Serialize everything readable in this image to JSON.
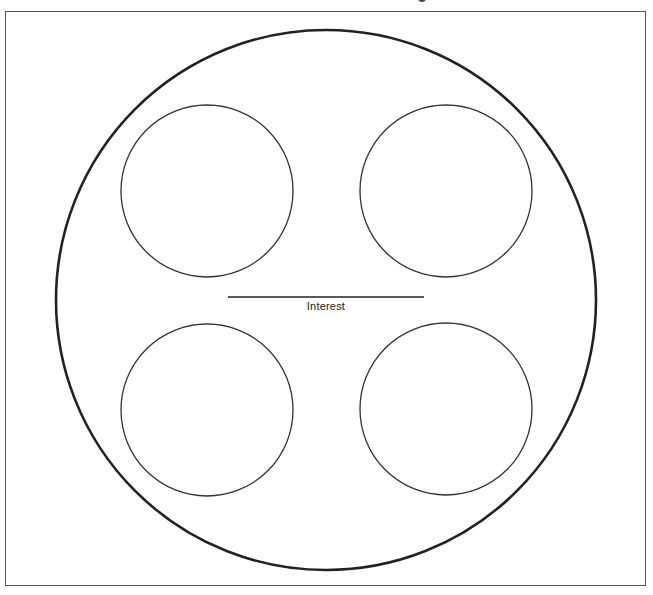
{
  "diagram": {
    "type": "graphic-organizer",
    "center_label": "Interest",
    "colors": {
      "stroke": "#222222",
      "frame": "#555555",
      "background": "#ffffff"
    },
    "outer_circle": {
      "cx": 326,
      "cy": 300,
      "r": 270
    },
    "inner_circles": [
      {
        "position": "top-left",
        "cx": 207,
        "cy": 191,
        "r": 86,
        "text": ""
      },
      {
        "position": "top-right",
        "cx": 446,
        "cy": 191,
        "r": 86,
        "text": ""
      },
      {
        "position": "bottom-left",
        "cx": 207,
        "cy": 410,
        "r": 86,
        "text": ""
      },
      {
        "position": "bottom-right",
        "cx": 446,
        "cy": 409,
        "r": 86,
        "text": ""
      }
    ],
    "center_line": {
      "x1": 228,
      "x2": 424,
      "y": 297
    }
  }
}
